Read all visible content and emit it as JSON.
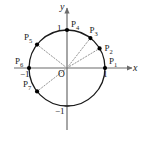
{
  "figure": {
    "type": "geometry-diagram",
    "colors": {
      "stroke": "#1a1a1a",
      "axis": "#6b6b6b",
      "dotted": "#8a8a8a",
      "point": "#000000",
      "background": "#ffffff"
    },
    "axes": {
      "x_label": "x",
      "y_label": "y",
      "origin_label": "O",
      "x_tick_pos": "1",
      "x_tick_neg": "−1",
      "y_tick_pos": "1",
      "y_tick_neg": "−1"
    },
    "circle": {
      "center_px": [
        67,
        68
      ],
      "radius_px": 38,
      "radius_units": 1
    },
    "points": [
      {
        "name": "P",
        "sub": "1",
        "angle_deg": 0,
        "label_dx": 4,
        "label_dy": -11
      },
      {
        "name": "P",
        "sub": "2",
        "angle_deg": 31,
        "label_dx": 5,
        "label_dy": -4
      },
      {
        "name": "P",
        "sub": "3",
        "angle_deg": 52,
        "label_dx": -1,
        "label_dy": -12
      },
      {
        "name": "P",
        "sub": "4",
        "angle_deg": 90,
        "label_dx": 4,
        "label_dy": -10
      },
      {
        "name": "P",
        "sub": "5",
        "angle_deg": 142,
        "label_dx": -13,
        "label_dy": -12
      },
      {
        "name": "P",
        "sub": "6",
        "angle_deg": 180,
        "label_dx": -14,
        "label_dy": -11
      },
      {
        "name": "P",
        "sub": "7",
        "angle_deg": 218,
        "label_dx": -14,
        "label_dy": -11
      }
    ],
    "dotted_radii_to": [
      "2",
      "3",
      "5",
      "7"
    ]
  }
}
